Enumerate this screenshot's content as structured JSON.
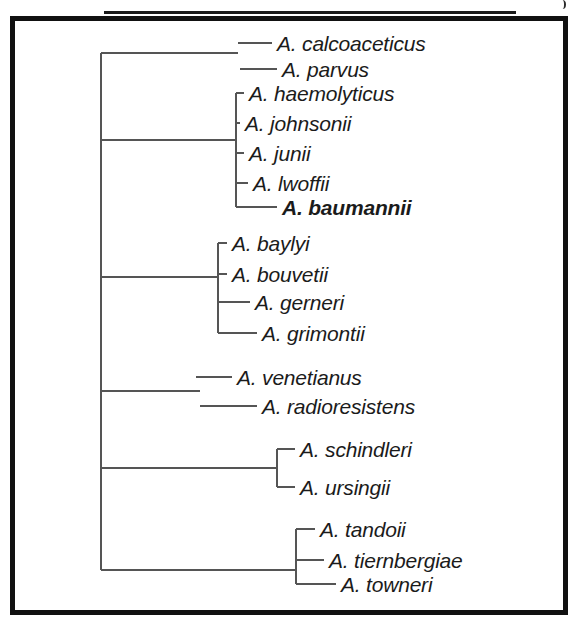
{
  "figure": {
    "type": "phylogenetic-tree",
    "orientation": "horizontal-rectangular-cladogram",
    "frame": {
      "border_color": "#111111",
      "background": "#ffffff"
    },
    "text_color": "#1b1b1b",
    "line_color": "#555555",
    "highlighted_taxon": "A. baumannii"
  },
  "taxa": [
    {
      "id": "calcoaceticus",
      "label": "A. calcoaceticus",
      "bold": false,
      "x": 277,
      "y": 43,
      "tip_x": 238
    },
    {
      "id": "parvus",
      "label": "A. parvus",
      "bold": false,
      "x": 282,
      "y": 69,
      "tip_x": 240
    },
    {
      "id": "haemolyticus",
      "label": "A. haemolyticus",
      "bold": false,
      "x": 249,
      "y": 93,
      "tip_x": 236
    },
    {
      "id": "johnsonii",
      "label": "A. johnsonii",
      "bold": false,
      "x": 245,
      "y": 123,
      "tip_x": 236
    },
    {
      "id": "junii",
      "label": "A. junii",
      "bold": false,
      "x": 249,
      "y": 153,
      "tip_x": 236
    },
    {
      "id": "lwoffii",
      "label": "A. lwoffii",
      "bold": false,
      "x": 253,
      "y": 183,
      "tip_x": 236
    },
    {
      "id": "baumannii",
      "label": "A. baumannii",
      "bold": true,
      "x": 282,
      "y": 207,
      "tip_x": 236
    },
    {
      "id": "baylyi",
      "label": "A. baylyi",
      "bold": false,
      "x": 232,
      "y": 243,
      "tip_x": 218
    },
    {
      "id": "bouvetii",
      "label": "A. bouvetii",
      "bold": false,
      "x": 232,
      "y": 274,
      "tip_x": 218
    },
    {
      "id": "gerneri",
      "label": "A. gerneri",
      "bold": false,
      "x": 255,
      "y": 302,
      "tip_x": 218
    },
    {
      "id": "grimontii",
      "label": "A. grimontii",
      "bold": false,
      "x": 262,
      "y": 333,
      "tip_x": 218
    },
    {
      "id": "venetianus",
      "label": "A. venetianus",
      "bold": false,
      "x": 237,
      "y": 377,
      "tip_x": 196
    },
    {
      "id": "radioresistens",
      "label": "A. radioresistens",
      "bold": false,
      "x": 262,
      "y": 406,
      "tip_x": 200
    },
    {
      "id": "schindleri",
      "label": "A. schindleri",
      "bold": false,
      "x": 300,
      "y": 449,
      "tip_x": 277
    },
    {
      "id": "ursingii",
      "label": "A. ursingii",
      "bold": false,
      "x": 300,
      "y": 487,
      "tip_x": 277
    },
    {
      "id": "tandoii",
      "label": "A. tandoii",
      "bold": false,
      "x": 320,
      "y": 529,
      "tip_x": 296
    },
    {
      "id": "tiernbergiae",
      "label": "A. tiernbergiae",
      "bold": false,
      "x": 329,
      "y": 560,
      "tip_x": 296
    },
    {
      "id": "towneri",
      "label": "A. towneri",
      "bold": false,
      "x": 341,
      "y": 584,
      "tip_x": 296
    }
  ],
  "clades": [
    {
      "id": "root-spine",
      "x": 101,
      "y_top": 53,
      "y_bottom": 570
    },
    {
      "id": "acb-clade",
      "x": 236,
      "y_top": 93,
      "y_bottom": 207
    },
    {
      "id": "baylyi-clade",
      "x": 218,
      "y_top": 243,
      "y_bottom": 333
    },
    {
      "id": "schindleri-clade",
      "x": 277,
      "y_top": 449,
      "y_bottom": 487
    },
    {
      "id": "tandoii-clade",
      "x": 296,
      "y_top": 529,
      "y_bottom": 584
    }
  ],
  "root_branches": [
    {
      "id": "branch-to-calcoaceticus-parvus",
      "y": 53,
      "x1": 101,
      "x2": 238
    },
    {
      "id": "branch-to-acb-clade",
      "y": 140,
      "x1": 101,
      "x2": 236
    },
    {
      "id": "branch-to-baylyi-clade",
      "y": 277,
      "x1": 101,
      "x2": 218
    },
    {
      "id": "branch-to-venetianus-group",
      "y": 391,
      "x1": 101,
      "x2": 200
    },
    {
      "id": "branch-to-schindleri-clade",
      "y": 468,
      "x1": 101,
      "x2": 277
    },
    {
      "id": "branch-to-tandoii-clade",
      "y": 570,
      "x1": 101,
      "x2": 296
    }
  ]
}
